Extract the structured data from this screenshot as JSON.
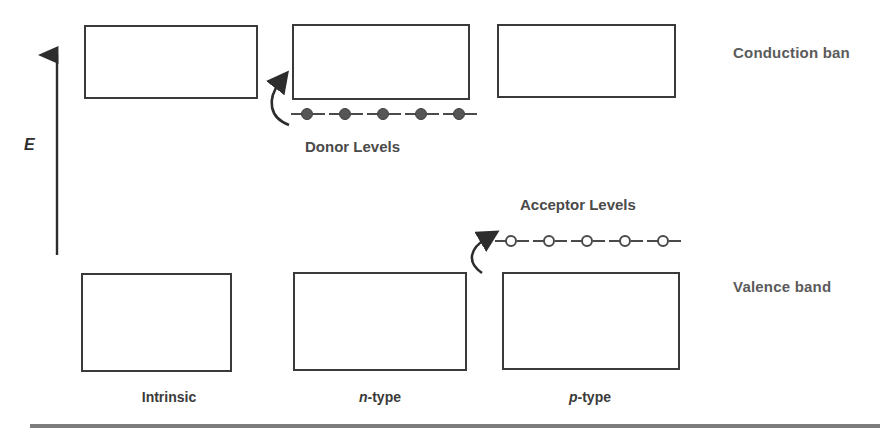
{
  "diagram": {
    "title_region": "semiconductor-band-diagram",
    "energy_axis": {
      "label": "E",
      "icon": "up-arrow-icon"
    },
    "side_labels": {
      "conduction": "Conduction ban",
      "valence": "Valence band"
    },
    "level_labels": {
      "donor": "Donor Levels",
      "acceptor": "Acceptor Levels"
    },
    "column_labels": [
      {
        "id": "intrinsic",
        "text": "Intrinsic",
        "italic_prefix": "",
        "rest": "Intrinsic"
      },
      {
        "id": "n-type",
        "text": "n-type",
        "italic_prefix": "n",
        "rest": "-type"
      },
      {
        "id": "p-type",
        "text": "p-type",
        "italic_prefix": "p",
        "rest": "-type"
      }
    ],
    "bands": {
      "conduction": [
        {
          "id": "conduction-intrinsic"
        },
        {
          "id": "conduction-n-type"
        },
        {
          "id": "conduction-p-type"
        }
      ],
      "valence": [
        {
          "id": "valence-intrinsic"
        },
        {
          "id": "valence-n-type"
        },
        {
          "id": "valence-p-type"
        }
      ]
    },
    "donor_levels": {
      "count": 5,
      "style": "filled",
      "description": "five filled donor states just below conduction band of n-type"
    },
    "acceptor_levels": {
      "count": 5,
      "style": "open",
      "description": "five empty acceptor states just above valence band of p-type"
    },
    "arrows": [
      {
        "id": "donor-excitation-arrow",
        "from": "donor-levels",
        "to": "conduction-band-n-type"
      },
      {
        "id": "acceptor-excitation-arrow",
        "from": "valence-band-p-type",
        "to": "acceptor-levels"
      }
    ],
    "colors": {
      "box_stroke": "#3a3a3a",
      "node_fill": "#565656",
      "text_primary": "#3a3a3a",
      "text_secondary": "#5b5b5b",
      "footer_rule": "#7d7d7d"
    }
  }
}
